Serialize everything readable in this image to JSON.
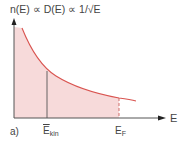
{
  "diagram": {
    "title": "n(E) ∝ D(E) ∝ 1/√E",
    "x_axis_label": "E",
    "panel_label": "a)",
    "markers": [
      {
        "label_main": "E",
        "label_sub": "kin",
        "overline": true,
        "style": "solid"
      },
      {
        "label_main": "E",
        "label_sub": "F",
        "overline": false,
        "style": "dashed"
      }
    ],
    "colors": {
      "curve": "#d9534f",
      "fill": "#f7dada",
      "axis": "#555555",
      "marker": "#555555"
    }
  }
}
